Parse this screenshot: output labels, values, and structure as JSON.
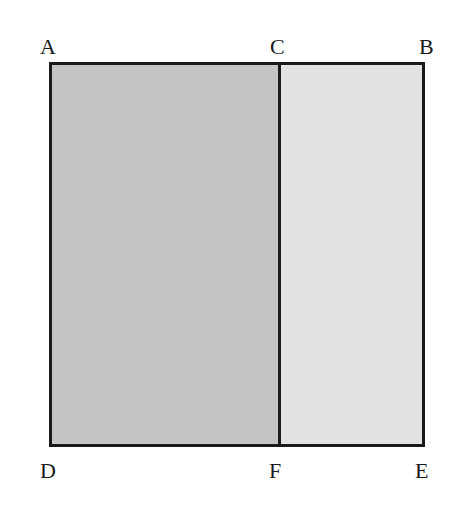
{
  "diagram": {
    "type": "rectangle-partition",
    "vertices": {
      "A": "A",
      "B": "B",
      "C": "C",
      "D": "D",
      "E": "E",
      "F": "F"
    },
    "regions": [
      {
        "name": "ACFD",
        "fill": "#c4c4c4",
        "shade": "dark gray"
      },
      {
        "name": "CBEF",
        "fill": "#e2e2e2",
        "shade": "light gray"
      }
    ],
    "segments": [
      "AB",
      "BE",
      "ED",
      "DA",
      "CF"
    ],
    "colors": {
      "outline": "#1a1a1a",
      "left_region": "#c4c4c4",
      "right_region": "#e2e2e2",
      "background": "#ffffff"
    }
  }
}
